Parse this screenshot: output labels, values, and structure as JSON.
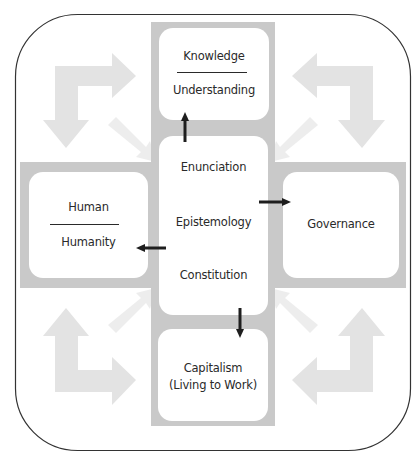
{
  "diagram": {
    "colors": {
      "outer_border": "#333333",
      "band": "#c9c9c9",
      "corner_arrow": "#e3e3e3",
      "diagonal_arrow": "#ededed",
      "box_fill": "#ffffff",
      "connector": "#1e1e1e",
      "text": "#2a2a2a"
    },
    "center": {
      "lines": [
        "Enunciation",
        "Epistemology",
        "Constitution"
      ]
    },
    "top": {
      "title": "Knowledge",
      "subtitle": "Understanding",
      "divided": true
    },
    "left": {
      "title": "Human",
      "subtitle": "Humanity",
      "divided": true
    },
    "right": {
      "title": "Governance"
    },
    "bottom": {
      "title": "Capitalism",
      "subtitle": "(Living to Work)"
    },
    "connectors": [
      {
        "from": "center",
        "to": "top",
        "direction": "up"
      },
      {
        "from": "center",
        "to": "right",
        "direction": "right"
      },
      {
        "from": "center",
        "to": "left",
        "direction": "left"
      },
      {
        "from": "center",
        "to": "bottom",
        "direction": "down"
      }
    ],
    "corner_arrows": [
      "top-left",
      "top-right",
      "bottom-left",
      "bottom-right"
    ]
  }
}
